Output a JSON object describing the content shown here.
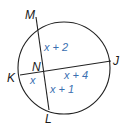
{
  "diagram": {
    "colors": {
      "stroke": "#222222",
      "label": "#1a1a1a",
      "expression": "#3a6fb0"
    },
    "points": {
      "M": "M",
      "J": "J",
      "K": "K",
      "L": "L",
      "N": "N"
    },
    "segments": {
      "MN": "x + 2",
      "NJ": "x + 4",
      "KN": "x",
      "NL": "x + 1"
    },
    "chords": [
      "ML",
      "KJ"
    ]
  }
}
